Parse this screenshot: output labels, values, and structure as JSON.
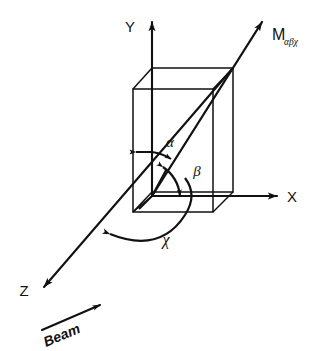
{
  "figure": {
    "kind": "vector-orientation-diagram",
    "background_color": "#ffffff",
    "ink_color": "#111111",
    "axes": [
      {
        "id": "y",
        "label": "Y",
        "direction": "up"
      },
      {
        "id": "x",
        "label": "X",
        "direction": "right"
      },
      {
        "id": "z",
        "label": "Z",
        "direction": "lower-left"
      }
    ],
    "vector": {
      "symbol": "M",
      "subscript": "αβχ",
      "full_label": "Mαβχ"
    },
    "angles": [
      {
        "id": "alpha",
        "label": "α",
        "between": "Y-axis and M vector"
      },
      {
        "id": "beta",
        "label": "β",
        "between": "M vector and X-axis"
      },
      {
        "id": "chi",
        "label": "χ",
        "between": "Z-axis and X-axis"
      }
    ],
    "beam": {
      "label": "Beam",
      "direction": "toward origin along Z"
    },
    "shape": {
      "name": "rectangular-box",
      "description": "wireframe rectangular parallelepiped centered on origin"
    }
  }
}
